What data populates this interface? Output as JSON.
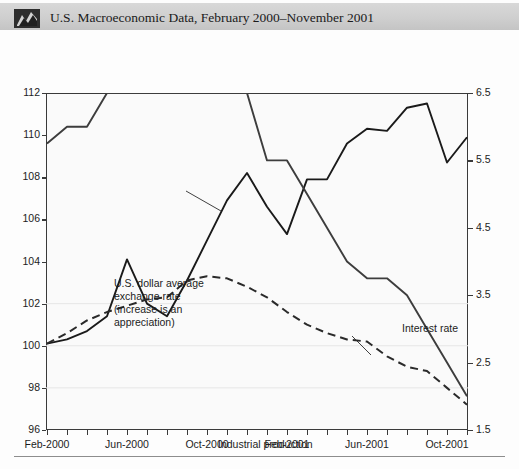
{
  "header": {
    "title": "U.S. Macroeconomic Data, February 2000–November 2001",
    "icon": "chart-thumbnail-icon"
  },
  "captions": {
    "left": "Industrial production, average exchange rate\n(indexes, February 2000 = 100)",
    "right": "Interest rate\n(Federal Reserve target rate)"
  },
  "annotations": {
    "exchange_rate": "U.S. dollar average\nexchange rate\n(increase is an\nappreciation)",
    "interest_rate": "Interest rate",
    "industrial_production": "Industrial production"
  },
  "chart_data": {
    "type": "line",
    "title": "U.S. Macroeconomic Data, February 2000–November 2001",
    "xlabel": "",
    "ylabel": "Industrial production, average exchange rate (indexes, February 2000 = 100)",
    "y2label": "Interest rate (Federal Reserve target rate)",
    "grid": false,
    "legend": "annotations-inline",
    "x": [
      "Feb-2000",
      "Mar-2000",
      "Apr-2000",
      "May-2000",
      "Jun-2000",
      "Jul-2000",
      "Aug-2000",
      "Sep-2000",
      "Oct-2000",
      "Nov-2000",
      "Dec-2000",
      "Jan-2001",
      "Feb-2001",
      "Mar-2001",
      "Apr-2001",
      "May-2001",
      "Jun-2001",
      "Jul-2001",
      "Aug-2001",
      "Sep-2001",
      "Oct-2001",
      "Nov-2001"
    ],
    "xticklabels": [
      "Feb-2000",
      "Jun-2000",
      "Oct-2000",
      "Feb-2001",
      "Jun-2001",
      "Oct-2001"
    ],
    "xtick_indices": [
      0,
      4,
      8,
      12,
      16,
      20
    ],
    "ylim": [
      96,
      112
    ],
    "yticks": [
      96,
      98,
      100,
      102,
      104,
      106,
      108,
      110,
      112
    ],
    "y2lim": [
      1.5,
      6.5
    ],
    "y2ticks": [
      1.5,
      2.5,
      3.5,
      4.5,
      5.5,
      6.5
    ],
    "series": [
      {
        "name": "U.S. dollar average exchange rate",
        "axis": "left",
        "style": "solid",
        "color": "#1a1a1a",
        "values": [
          100.1,
          100.3,
          100.7,
          101.4,
          104.1,
          102.0,
          101.4,
          103.1,
          105.0,
          106.9,
          108.2,
          106.6,
          105.3,
          107.9,
          107.9,
          109.6,
          110.3,
          110.2,
          111.3,
          111.5,
          108.7,
          109.9
        ]
      },
      {
        "name": "Industrial production",
        "axis": "left",
        "style": "dashed",
        "color": "#2a2a2a",
        "values": [
          100.1,
          100.6,
          101.2,
          101.6,
          101.9,
          102.2,
          102.3,
          103.1,
          103.3,
          103.2,
          102.8,
          102.3,
          101.6,
          101.0,
          100.6,
          100.3,
          100.2,
          99.5,
          99.0,
          98.8,
          98.0,
          97.2
        ]
      },
      {
        "name": "Interest rate",
        "axis": "right",
        "style": "solid",
        "color": "#3d3d3d",
        "values": [
          5.75,
          6.0,
          6.0,
          6.5,
          6.5,
          6.5,
          6.5,
          6.5,
          6.5,
          6.5,
          6.5,
          5.5,
          5.5,
          5.0,
          4.5,
          4.0,
          3.75,
          3.75,
          3.5,
          3.0,
          2.5,
          2.0
        ]
      }
    ]
  }
}
